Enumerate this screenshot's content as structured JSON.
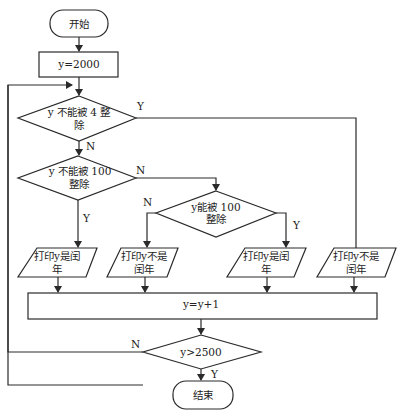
{
  "flowchart": {
    "start": "开始",
    "init": "y=2000",
    "cond1": {
      "line1": "y 不能被 4 整",
      "line2": "除",
      "yes": "Y",
      "no": "N"
    },
    "cond2": {
      "line1": "y 不能被 100",
      "line2": "整除",
      "yes": "Y",
      "no": "N"
    },
    "cond3": {
      "line1": "y能被 100",
      "line2": "整除",
      "yes": "Y",
      "no": "N"
    },
    "out1": {
      "line1": "打印y是闰",
      "line2": "年"
    },
    "out2": {
      "line1": "打印y不是",
      "line2": "闰年"
    },
    "out3": {
      "line1": "打印y是闰",
      "line2": "年"
    },
    "out4": {
      "line1": "打印y不是",
      "line2": "闰年"
    },
    "increment": "y=y+1",
    "cond4": {
      "text": "y>2500",
      "yes": "Y",
      "no": "N"
    },
    "end": "结束"
  }
}
